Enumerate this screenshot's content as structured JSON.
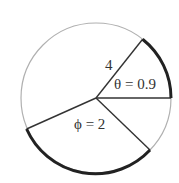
{
  "diagram": {
    "radius_label": "4",
    "theta_label": "θ = 0.9",
    "phi_label": "ϕ = 2",
    "colors": {
      "circle": "#aaaaaa",
      "arc": "#222222",
      "line": "#333333"
    }
  }
}
